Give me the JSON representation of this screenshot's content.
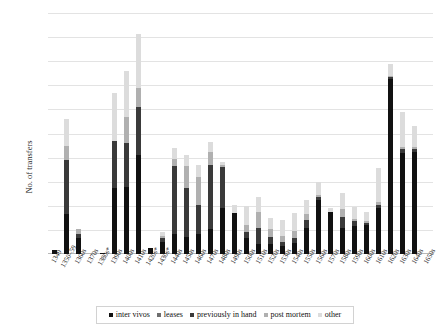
{
  "chart_data": {
    "type": "bar",
    "stacked": true,
    "title": "",
    "xlabel": "",
    "ylabel": "No. of transfers",
    "ylim": [
      0,
      200
    ],
    "ytick_step": 20,
    "yticks": [
      0,
      20,
      40,
      60,
      80,
      100,
      120,
      140,
      160,
      180,
      200
    ],
    "ytick_labels": [
      "0",
      "20",
      "40",
      "60",
      "80",
      "100",
      "120",
      "140",
      "160",
      "180",
      "200"
    ],
    "grid": true,
    "legend_position": "bottom",
    "categories": [
      "1349",
      "1350–59",
      "1360s",
      "1370s",
      "1380s*",
      "1390s",
      "1400s",
      "1410s",
      "1420s*",
      "1430s*",
      "1440s",
      "1450s",
      "1460s",
      "1470s",
      "1480s",
      "1490s",
      "1500s",
      "1510s",
      "1520s",
      "1530s",
      "1540s",
      "1550s",
      "1560s",
      "1570s",
      "1580s",
      "1590s",
      "1600s",
      "1610s",
      "1620s",
      "1630s",
      "1640s",
      "1650s"
    ],
    "series": [
      {
        "name": "inter vivos",
        "color": "#111111",
        "values": [
          3,
          12,
          13,
          0,
          5,
          1,
          55,
          56,
          82,
          0,
          10,
          17,
          14,
          17,
          21,
          38,
          34,
          13,
          8,
          8,
          7,
          9,
          22,
          45,
          35,
          22,
          23,
          24,
          38,
          145,
          84,
          85
        ]
      },
      {
        "name": "leases",
        "color": "#6e6e6e",
        "values": [
          0,
          0,
          0,
          0,
          0,
          0,
          0,
          0,
          0,
          0,
          0,
          0,
          0,
          0,
          0,
          0,
          0,
          0,
          0,
          0,
          0,
          0,
          0,
          0,
          0,
          0,
          0,
          0,
          0,
          0,
          0,
          0
        ]
      },
      {
        "name": "previously in hand",
        "color": "#3a3a3a",
        "values": [
          0,
          0,
          0,
          0,
          0,
          0,
          0,
          0,
          0,
          0,
          0,
          0,
          0,
          0,
          0,
          0,
          0,
          0,
          0,
          0,
          0,
          0,
          0,
          0,
          0,
          0,
          0,
          0,
          0,
          0,
          0,
          0
        ]
      },
      {
        "name": "post mortem",
        "color": "#8f8f8f",
        "values": [
          0,
          0,
          0,
          0,
          0,
          0,
          0,
          0,
          0,
          0,
          0,
          0,
          0,
          0,
          0,
          0,
          0,
          0,
          0,
          0,
          0,
          0,
          0,
          0,
          0,
          0,
          0,
          0,
          0,
          0,
          0,
          0
        ]
      },
      {
        "name": "other",
        "color": "#cfcfcf",
        "values": [
          0,
          0,
          0,
          0,
          0,
          0,
          0,
          0,
          0,
          0,
          0,
          0,
          0,
          0,
          0,
          0,
          0,
          0,
          0,
          0,
          0,
          0,
          0,
          0,
          0,
          0,
          0,
          0,
          0,
          0,
          0,
          0
        ]
      }
    ],
    "stacks": [
      {
        "category": "1349",
        "inter vivos": 3,
        "leases": 0,
        "previously in hand": 0,
        "post mortem": 0,
        "other": 0
      },
      {
        "category": "1350–59",
        "inter vivos": 33,
        "leases": 0,
        "previously in hand": 45,
        "post mortem": 12,
        "other": 22
      },
      {
        "category": "1360s",
        "inter vivos": 13,
        "leases": 0,
        "previously in hand": 4,
        "post mortem": 4,
        "other": 0
      },
      {
        "category": "1370s",
        "inter vivos": 0,
        "leases": 0,
        "previously in hand": 0,
        "post mortem": 0,
        "other": 0
      },
      {
        "category": "1380s*",
        "inter vivos": 1,
        "leases": 0,
        "previously in hand": 0,
        "post mortem": 0,
        "other": 0
      },
      {
        "category": "1390s",
        "inter vivos": 55,
        "leases": 0,
        "previously in hand": 39,
        "post mortem": 0,
        "other": 40
      },
      {
        "category": "1400s",
        "inter vivos": 56,
        "leases": 0,
        "previously in hand": 36,
        "post mortem": 22,
        "other": 38
      },
      {
        "category": "1410s",
        "inter vivos": 82,
        "leases": 0,
        "previously in hand": 40,
        "post mortem": 16,
        "other": 45
      },
      {
        "category": "1420s*",
        "inter vivos": 5,
        "leases": 0,
        "previously in hand": 0,
        "post mortem": 0,
        "other": 0
      },
      {
        "category": "1430s*",
        "inter vivos": 10,
        "leases": 0,
        "previously in hand": 3,
        "post mortem": 2,
        "other": 3
      },
      {
        "category": "1440s",
        "inter vivos": 17,
        "leases": 0,
        "previously in hand": 56,
        "post mortem": 6,
        "other": 9
      },
      {
        "category": "1450s",
        "inter vivos": 14,
        "leases": 0,
        "previously in hand": 41,
        "post mortem": 18,
        "other": 9
      },
      {
        "category": "1460s",
        "inter vivos": 17,
        "leases": 0,
        "previously in hand": 24,
        "post mortem": 23,
        "other": 10
      },
      {
        "category": "1470s",
        "inter vivos": 21,
        "leases": 0,
        "previously in hand": 53,
        "post mortem": 11,
        "other": 8
      },
      {
        "category": "1480s",
        "inter vivos": 38,
        "leases": 0,
        "previously in hand": 34,
        "post mortem": 2,
        "other": 2
      },
      {
        "category": "1490s",
        "inter vivos": 34,
        "leases": 0,
        "previously in hand": 0,
        "post mortem": 0,
        "other": 7
      },
      {
        "category": "1500s",
        "inter vivos": 13,
        "leases": 0,
        "previously in hand": 5,
        "post mortem": 6,
        "other": 16
      },
      {
        "category": "1510s",
        "inter vivos": 8,
        "leases": 0,
        "previously in hand": 14,
        "post mortem": 13,
        "other": 12
      },
      {
        "category": "1520s",
        "inter vivos": 8,
        "leases": 0,
        "previously in hand": 6,
        "post mortem": 7,
        "other": 9
      },
      {
        "category": "1530s",
        "inter vivos": 7,
        "leases": 0,
        "previously in hand": 3,
        "post mortem": 5,
        "other": 13
      },
      {
        "category": "1540s",
        "inter vivos": 9,
        "leases": 0,
        "previously in hand": 4,
        "post mortem": 6,
        "other": 15
      },
      {
        "category": "1550s",
        "inter vivos": 22,
        "leases": 0,
        "previously in hand": 6,
        "post mortem": 5,
        "other": 12
      },
      {
        "category": "1560s",
        "inter vivos": 45,
        "leases": 0,
        "previously in hand": 2,
        "post mortem": 2,
        "other": 11
      },
      {
        "category": "1570s",
        "inter vivos": 35,
        "leases": 0,
        "previously in hand": 0,
        "post mortem": 0,
        "other": 3
      },
      {
        "category": "1580s",
        "inter vivos": 22,
        "leases": 0,
        "previously in hand": 9,
        "post mortem": 6,
        "other": 14
      },
      {
        "category": "1590s",
        "inter vivos": 23,
        "leases": 0,
        "previously in hand": 4,
        "post mortem": 2,
        "other": 10
      },
      {
        "category": "1600s",
        "inter vivos": 24,
        "leases": 0,
        "previously in hand": 2,
        "post mortem": 1,
        "other": 8
      },
      {
        "category": "1610s",
        "inter vivos": 38,
        "leases": 0,
        "previously in hand": 3,
        "post mortem": 2,
        "other": 28
      },
      {
        "category": "1620s",
        "inter vivos": 145,
        "leases": 0,
        "previously in hand": 2,
        "post mortem": 1,
        "other": 10
      },
      {
        "category": "1630s",
        "inter vivos": 84,
        "leases": 0,
        "previously in hand": 3,
        "post mortem": 2,
        "other": 29
      },
      {
        "category": "1640s",
        "inter vivos": 85,
        "leases": 0,
        "previously in hand": 2,
        "post mortem": 2,
        "other": 17
      },
      {
        "category": "1650s",
        "inter vivos": 0,
        "leases": 0,
        "previously in hand": 0,
        "post mortem": 0,
        "other": 0
      }
    ],
    "legend": [
      {
        "label": "inter vivos",
        "color": "#111111"
      },
      {
        "label": "leases",
        "color": "#6e6e6e"
      },
      {
        "label": "previously in hand",
        "color": "#3a3a3a"
      },
      {
        "label": "post mortem",
        "color": "#b0b0b0"
      },
      {
        "label": "other",
        "color": "#dcdcdc"
      }
    ]
  }
}
